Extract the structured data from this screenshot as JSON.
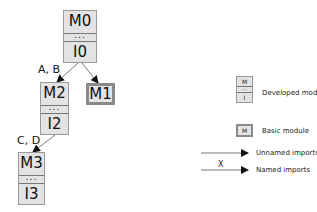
{
  "diagram": {
    "nodes": [
      {
        "id": "M0",
        "type": "developed",
        "top": "M0",
        "middle": "...",
        "bottom": "I0"
      },
      {
        "id": "M2",
        "type": "developed",
        "top": "M2",
        "middle": "...",
        "bottom": "I2"
      },
      {
        "id": "M1",
        "type": "basic",
        "label": "M1"
      },
      {
        "id": "M3",
        "type": "developed",
        "top": "M3",
        "middle": "...",
        "bottom": "I3"
      }
    ],
    "edges": [
      {
        "from": "M0",
        "to": "M2",
        "label": "A, B",
        "kind": "named"
      },
      {
        "from": "M0",
        "to": "M1",
        "label": "",
        "kind": "unnamed"
      },
      {
        "from": "M2",
        "to": "M3",
        "label": "C, D",
        "kind": "named"
      }
    ]
  },
  "legend": {
    "developed": {
      "top": "M",
      "middle": "...",
      "bottom": "I",
      "label": "Developed module"
    },
    "basic": {
      "symbol": "M",
      "label": "Basic module"
    },
    "unnamed": {
      "label": "Unnamed imports"
    },
    "named": {
      "symbol": "X",
      "label": "Named imports"
    }
  },
  "colors": {
    "box_fill": "#e3e3e3",
    "box_border": "#9a9a9a",
    "basic_border": "#8a8a8a",
    "arrow": "#111111"
  }
}
